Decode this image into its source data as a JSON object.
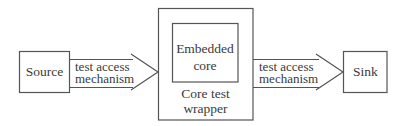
{
  "diagram": {
    "nodes": {
      "source": {
        "label": "Source"
      },
      "wrapper": {
        "label_line1": "Core test",
        "label_line2": "wrapper"
      },
      "core": {
        "label_line1": "Embedded",
        "label_line2": "core"
      },
      "sink": {
        "label": "Sink"
      }
    },
    "edges": [
      {
        "from": "source",
        "to": "wrapper",
        "label_line1": "test access",
        "label_line2": "mechanism"
      },
      {
        "from": "wrapper",
        "to": "sink",
        "label_line1": "test access",
        "label_line2": "mechanism"
      }
    ],
    "colors": {
      "stroke": "#555555",
      "text": "#3a3a3a",
      "background": "#ffffff"
    }
  }
}
